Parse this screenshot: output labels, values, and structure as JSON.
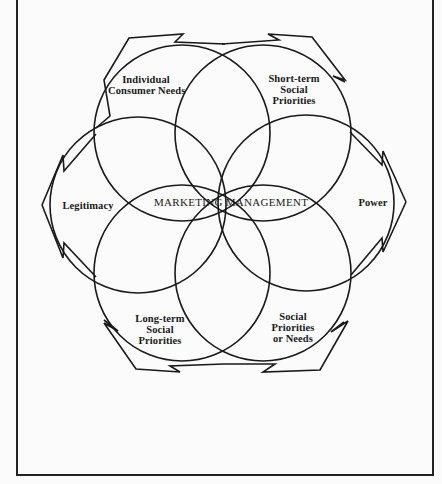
{
  "diagram": {
    "center_label": "MARKETING MANAGEMENT",
    "petals": [
      {
        "id": "individual-consumer-needs",
        "lines": [
          "Individual",
          "Consumer Needs"
        ]
      },
      {
        "id": "short-term-social-priorities",
        "lines": [
          "Short-term",
          "Social",
          "Priorities"
        ]
      },
      {
        "id": "power",
        "lines": [
          "Power"
        ]
      },
      {
        "id": "social-priorities-or-needs",
        "lines": [
          "Social",
          "Priorities",
          "or Needs"
        ]
      },
      {
        "id": "long-term-social-priorities",
        "lines": [
          "Long-term",
          "Social",
          "Priorities"
        ]
      },
      {
        "id": "legitimacy",
        "lines": [
          "Legitimacy"
        ]
      }
    ],
    "colors": {
      "line": "#1a1a1a",
      "background": "#fbfbfb"
    }
  }
}
